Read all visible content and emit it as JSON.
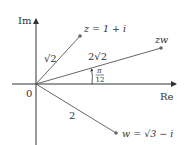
{
  "diagram": {
    "axes": {
      "imaginary_label": "Im",
      "real_label": "Re",
      "origin_label": "0"
    },
    "points": {
      "z": {
        "label": "z = 1 + i",
        "modulus_label": "√2"
      },
      "zw": {
        "label": "zw",
        "modulus_label": "2√2"
      },
      "w": {
        "label": "w = √3 − i",
        "modulus_label": "2"
      }
    },
    "angle": {
      "numerator": "π",
      "denominator": "12"
    },
    "colors": {
      "axis": "#333333",
      "ray": "#555555",
      "point": "#666666",
      "text": "#333333"
    }
  }
}
